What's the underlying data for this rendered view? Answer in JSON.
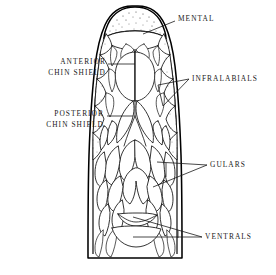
{
  "figure": {
    "background_color": "#ffffff",
    "ink_color": "#000000",
    "labels": [
      {
        "id": "mental",
        "text": "MENTAL",
        "lines": [
          "MENTAL"
        ],
        "x": 178,
        "y": 21,
        "anchor": "start"
      },
      {
        "id": "anterior-chin-shield",
        "text": "ANTERIOR CHIN SHIELD",
        "lines": [
          "ANTERIOR",
          "CHIN SHIELD"
        ],
        "x": 106,
        "y": 64,
        "anchor": "end"
      },
      {
        "id": "infralabials",
        "text": "INFRALABIALS",
        "lines": [
          "INFRALABIALS"
        ],
        "x": 192,
        "y": 81,
        "anchor": "start"
      },
      {
        "id": "posterior-chin-shield",
        "text": "POSTERIOR CHIN SHIELD",
        "lines": [
          "POSTERIOR",
          "CHIN SHIELD"
        ],
        "x": 104,
        "y": 116,
        "anchor": "end"
      },
      {
        "id": "gulars",
        "text": "GULARS",
        "lines": [
          "GULARS"
        ],
        "x": 210,
        "y": 167,
        "anchor": "start"
      },
      {
        "id": "ventrals",
        "text": "VENTRALS",
        "lines": [
          "VENTRALS"
        ],
        "x": 205,
        "y": 239,
        "anchor": "start"
      }
    ],
    "label_text": {
      "mental": "MENTAL",
      "anterior_line1": "ANTERIOR",
      "anterior_line2": "CHIN SHIELD",
      "infralabials": "INFRALABIALS",
      "posterior_line1": "POSTERIOR",
      "posterior_line2": "CHIN SHIELD",
      "gulars": "GULARS",
      "ventrals": "VENTRALS"
    }
  }
}
